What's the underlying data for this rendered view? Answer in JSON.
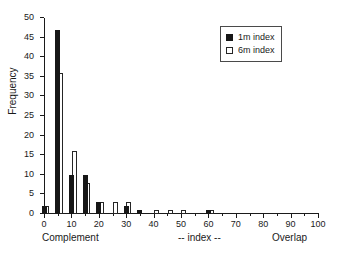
{
  "chart_data": {
    "type": "bar",
    "title": "",
    "xlabel": "-- index --",
    "ylabel": "Frequency",
    "xlim": [
      0,
      100
    ],
    "ylim": [
      0,
      50
    ],
    "grid": false,
    "legend_position": "top-right",
    "x_tick_labels": [
      "0",
      "10",
      "20",
      "30",
      "40",
      "50",
      "60",
      "70",
      "80",
      "90",
      "100"
    ],
    "x_tick_values": [
      0,
      10,
      20,
      30,
      40,
      50,
      60,
      70,
      80,
      90,
      100
    ],
    "x_minor_tick_values": [
      5,
      15,
      25,
      35,
      45,
      55,
      65,
      75,
      85,
      95
    ],
    "y_tick_labels": [
      "0",
      "5",
      "10",
      "15",
      "20",
      "25",
      "30",
      "35",
      "40",
      "45",
      "50"
    ],
    "y_tick_values": [
      0,
      5,
      10,
      15,
      20,
      25,
      30,
      35,
      40,
      45,
      50
    ],
    "axis_captions": {
      "left": "Complement",
      "middle": "-- index --",
      "right": "Overlap"
    },
    "series": [
      {
        "name": "1m index",
        "style": "filled",
        "color": "#171717",
        "x": [
          0,
          5,
          10,
          15,
          20,
          30,
          35,
          60
        ],
        "values": [
          2,
          47,
          10,
          10,
          3,
          2,
          1,
          1
        ]
      },
      {
        "name": "6m index",
        "style": "open",
        "color": "#ffffff",
        "edge_color": "#262626",
        "x": [
          1,
          6,
          11,
          16,
          21,
          26,
          31,
          41,
          46,
          51,
          61
        ],
        "values": [
          2,
          36,
          16,
          8,
          3,
          3,
          3,
          1,
          1,
          1,
          1
        ]
      }
    ]
  },
  "legend": {
    "entries": [
      {
        "label": "1m index",
        "swatch": "filled-square-icon"
      },
      {
        "label": "6m index",
        "swatch": "open-square-icon"
      }
    ]
  }
}
